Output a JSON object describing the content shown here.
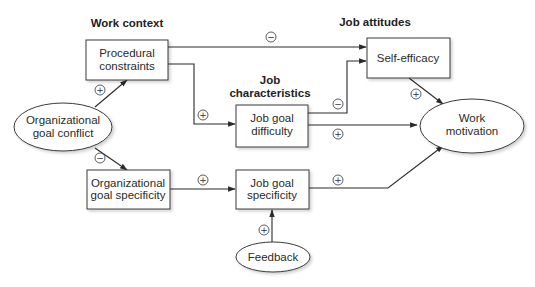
{
  "diagram": {
    "group_labels": {
      "work_context": "Work context",
      "job_characteristics_line1": "Job",
      "job_characteristics_line2": "characteristics",
      "job_attitudes": "Job attitudes"
    },
    "nodes": {
      "procedural_constraints": {
        "shape": "rect",
        "line1": "Procedural",
        "line2": "constraints"
      },
      "organizational_goal_conflict": {
        "shape": "ellipse",
        "line1": "Organizational",
        "line2": "goal conflict"
      },
      "organizational_goal_specificity": {
        "shape": "rect",
        "line1": "Organizational",
        "line2": "goal specificity"
      },
      "job_goal_difficulty": {
        "shape": "rect",
        "line1": "Job goal",
        "line2": "difficulty"
      },
      "job_goal_specificity": {
        "shape": "rect",
        "line1": "Job goal",
        "line2": "specificity"
      },
      "feedback": {
        "shape": "ellipse",
        "line1": "Feedback"
      },
      "self_efficacy": {
        "shape": "rect",
        "line1": "Self-efficacy"
      },
      "work_motivation": {
        "shape": "ellipse",
        "line1": "Work",
        "line2": "motivation"
      }
    },
    "edges": [
      {
        "from": "organizational_goal_conflict",
        "to": "procedural_constraints",
        "sign": "+"
      },
      {
        "from": "organizational_goal_conflict",
        "to": "organizational_goal_specificity",
        "sign": "−"
      },
      {
        "from": "procedural_constraints",
        "to": "self_efficacy",
        "sign": "−"
      },
      {
        "from": "procedural_constraints",
        "to": "job_goal_difficulty",
        "sign": "+"
      },
      {
        "from": "job_goal_difficulty",
        "to": "self_efficacy",
        "sign": "−"
      },
      {
        "from": "job_goal_difficulty",
        "to": "work_motivation",
        "sign": "+"
      },
      {
        "from": "self_efficacy",
        "to": "work_motivation",
        "sign": "+"
      },
      {
        "from": "organizational_goal_specificity",
        "to": "job_goal_specificity",
        "sign": "+"
      },
      {
        "from": "job_goal_specificity",
        "to": "work_motivation",
        "sign": "+"
      },
      {
        "from": "feedback",
        "to": "job_goal_specificity",
        "sign": "+"
      }
    ],
    "signs": {
      "plus": "+",
      "minus": "−"
    },
    "colors": {
      "stroke": "#3a3a3a",
      "fill": "#ffffff",
      "shadow": "#cfcfcf"
    }
  }
}
